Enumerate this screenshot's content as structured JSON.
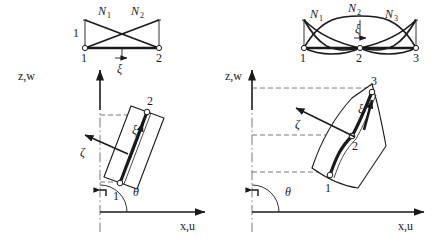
{
  "figure": {
    "caption_none": "",
    "panels": [
      {
        "id": "left",
        "element_type": "two-node linear element",
        "shape_function_plot": {
          "axis_value_label": "1",
          "curve_labels": [
            "N",
            "N"
          ],
          "curve_sub": [
            "1",
            "2"
          ],
          "node_labels": [
            "1",
            "2"
          ],
          "coord_label": "ξ"
        },
        "geometry": {
          "vertical_axis_label": "z,w",
          "horizontal_axis_label": "x,u",
          "angle_label": "θ",
          "axial_coord_label": "ξ",
          "normal_coord_label": "ζ",
          "node_labels": [
            "1",
            "2"
          ]
        }
      },
      {
        "id": "right",
        "element_type": "three-node quadratic element",
        "shape_function_plot": {
          "axis_value_label": "",
          "curve_labels": [
            "N",
            "N",
            "N"
          ],
          "curve_sub": [
            "1",
            "2",
            "3"
          ],
          "node_labels": [
            "1",
            "2",
            "3"
          ],
          "coord_label": "ξ"
        },
        "geometry": {
          "vertical_axis_label": "z,w",
          "horizontal_axis_label": "x,u",
          "angle_label": "θ",
          "axial_coord_label": "ξ",
          "normal_coord_label": "ζ",
          "node_labels": [
            "1",
            "2",
            "3"
          ]
        }
      }
    ],
    "colors": {
      "ink": "#1a1a1a",
      "line": "#000000",
      "dashed": "#555555",
      "fill": "#ffffff"
    }
  }
}
